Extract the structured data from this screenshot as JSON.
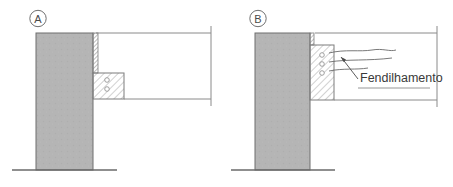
{
  "figure": {
    "title": "",
    "background_color": "#ffffff",
    "panels": [
      {
        "id": "panel-a",
        "label": "A",
        "label_shape": "circle",
        "description": "Corte de ligacao viga-pilar sem fendilhamento",
        "elements": {
          "column_label": "Pilar",
          "beam_label": "Viga",
          "bearing_pad_label": "Aparelho de apoio",
          "joint_strip_label": "Junta"
        }
      },
      {
        "id": "panel-b",
        "label": "B",
        "label_shape": "circle",
        "description": "Corte de ligacao viga-pilar com fendilhamento no consolo",
        "annotation": "Fendilhamento",
        "elements": {
          "column_label": "Pilar",
          "beam_label": "Viga",
          "corbel_label": "Consolo",
          "joint_strip_label": "Junta",
          "crack_marks_count": "3"
        }
      }
    ],
    "colors": {
      "column_fill": "#b5b5b5",
      "column_stroke": "#6e6e6e",
      "hatch_stroke": "#8c8c8c",
      "line_stroke": "#8a8a8a",
      "ground_stroke": "#6a6a6a",
      "text": "#3a3a3a"
    }
  }
}
